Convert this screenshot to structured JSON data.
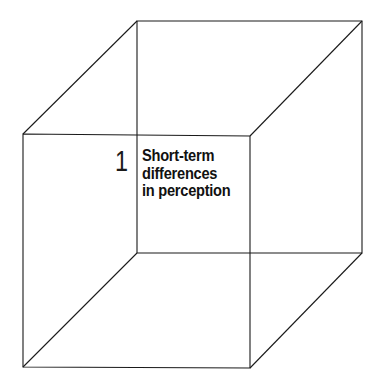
{
  "diagram": {
    "type": "wireframe-cube",
    "stroke_color": "#1a1a1a",
    "background": "#ffffff",
    "label": {
      "number": "1",
      "lines": [
        "Short-term",
        "differences",
        "in perception"
      ]
    }
  }
}
